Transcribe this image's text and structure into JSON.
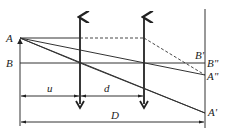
{
  "diagram": {
    "labels": {
      "A": "A",
      "B": "B",
      "B_prime": "B'",
      "B_double_prime": "B\"",
      "A_double_prime": "A\"",
      "A_prime": "A'",
      "u": "u",
      "d": "d",
      "D": "D"
    },
    "elements": [
      {
        "id": "object",
        "name": "Object AB",
        "from": "B",
        "to": "A"
      },
      {
        "id": "lens-1",
        "name": "Lens at position 1"
      },
      {
        "id": "lens-2",
        "name": "Lens at position 2"
      },
      {
        "id": "screen",
        "name": "Screen"
      }
    ],
    "dimensions": [
      {
        "id": "u",
        "label": "u",
        "meaning": "object to lens position 1"
      },
      {
        "id": "d",
        "label": "d",
        "meaning": "distance between lens positions"
      },
      {
        "id": "D",
        "label": "D",
        "meaning": "object to screen"
      }
    ],
    "colors": {
      "ink": "#222222",
      "background": "#ffffff"
    }
  }
}
